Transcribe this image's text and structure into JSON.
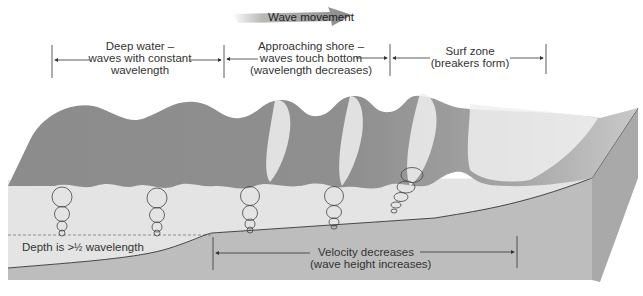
{
  "title_arrow": {
    "label": "Wave movement"
  },
  "zones": [
    {
      "lines": [
        "Deep water –",
        "waves with constant",
        "wavelength"
      ]
    },
    {
      "lines": [
        "Approaching shore –",
        "waves touch bottom",
        "(wavelength decreases)"
      ]
    },
    {
      "lines": [
        "Surf zone",
        "(breakers form)"
      ]
    }
  ],
  "depth_label": {
    "prefix": "Depth is >",
    "fraction": "½",
    "suffix": " wavelength"
  },
  "velocity_label": {
    "lines": [
      "Velocity decreases",
      "(wave height increases)"
    ]
  },
  "colors": {
    "water_surface": "#8e8e8e",
    "water_body": "#e3e3e3",
    "seafloor": "#bdbdbd",
    "block_side": "#a9a9a9",
    "foam": "#f2f2f2",
    "line": "#333333"
  }
}
